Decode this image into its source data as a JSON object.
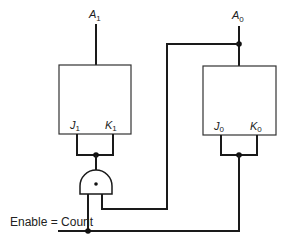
{
  "diagram": {
    "type": "2-bit counter with J-K flip-flops",
    "outputs": [
      {
        "name": "A",
        "subscript": "1"
      },
      {
        "name": "A",
        "subscript": "0"
      }
    ],
    "flipflops": [
      {
        "id": "ff1",
        "inputs": [
          {
            "name": "J",
            "subscript": "1"
          },
          {
            "name": "K",
            "subscript": "1"
          }
        ]
      },
      {
        "id": "ff0",
        "inputs": [
          {
            "name": "J",
            "subscript": "0"
          },
          {
            "name": "K",
            "subscript": "0"
          }
        ]
      }
    ],
    "gate": {
      "type": "AND",
      "symbol": "•"
    },
    "enable_label": "Enable = Count"
  },
  "colors": {
    "line": "#1a1a1a",
    "background": "#ffffff"
  }
}
